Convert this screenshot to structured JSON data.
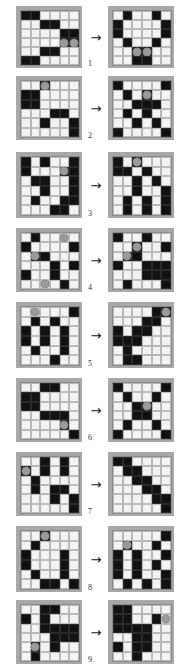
{
  "figure": {
    "type": "puzzle-sequence",
    "arrow_glyph": "→",
    "arrow_icon_name": "right-arrow-icon",
    "rows": 6,
    "cols": 6,
    "colors": {
      "page_background": "#ffffff",
      "frame": "#a8a8a8",
      "cell_white": "#f4f4f2",
      "cell_black": "#111111",
      "cell_border": "#b9b9b9",
      "dot": "#9a9a9a",
      "label_text": "#333333"
    }
  },
  "pairs": [
    {
      "number": "1",
      "left": {
        "cells": [
          [
            "b",
            "b",
            "w",
            "w",
            "w",
            "w"
          ],
          [
            "w",
            "w",
            "b",
            "b",
            "w",
            "w"
          ],
          [
            "w",
            "w",
            "w",
            "w",
            "b",
            "b"
          ],
          [
            "w",
            "w",
            "w",
            "w",
            "b",
            "b"
          ],
          [
            "w",
            "w",
            "b",
            "b",
            "w",
            "w"
          ],
          [
            "b",
            "b",
            "w",
            "w",
            "w",
            "w"
          ]
        ],
        "dots": [
          [
            3,
            4
          ],
          [
            3,
            5
          ]
        ]
      },
      "right": {
        "cells": [
          [
            "w",
            "b",
            "w",
            "w",
            "b",
            "w"
          ],
          [
            "b",
            "w",
            "w",
            "w",
            "w",
            "b"
          ],
          [
            "b",
            "w",
            "w",
            "w",
            "w",
            "b"
          ],
          [
            "w",
            "b",
            "w",
            "w",
            "b",
            "w"
          ],
          [
            "w",
            "w",
            "b",
            "b",
            "w",
            "w"
          ],
          [
            "w",
            "w",
            "b",
            "b",
            "w",
            "w"
          ]
        ],
        "dots": [
          [
            4,
            2
          ],
          [
            4,
            3
          ]
        ]
      }
    },
    {
      "number": "2",
      "left": {
        "cells": [
          [
            "w",
            "w",
            "b",
            "w",
            "w",
            "w"
          ],
          [
            "b",
            "b",
            "w",
            "w",
            "w",
            "w"
          ],
          [
            "b",
            "b",
            "w",
            "w",
            "w",
            "w"
          ],
          [
            "w",
            "w",
            "w",
            "b",
            "b",
            "w"
          ],
          [
            "w",
            "w",
            "b",
            "w",
            "w",
            "b"
          ],
          [
            "w",
            "w",
            "w",
            "w",
            "w",
            "b"
          ]
        ],
        "dots": [
          [
            0,
            2
          ]
        ]
      },
      "right": {
        "cells": [
          [
            "b",
            "w",
            "w",
            "w",
            "w",
            "b"
          ],
          [
            "w",
            "b",
            "w",
            "b",
            "w",
            "w"
          ],
          [
            "w",
            "w",
            "b",
            "b",
            "b",
            "w"
          ],
          [
            "w",
            "b",
            "w",
            "b",
            "w",
            "w"
          ],
          [
            "w",
            "w",
            "b",
            "w",
            "b",
            "w"
          ],
          [
            "b",
            "w",
            "w",
            "w",
            "w",
            "b"
          ]
        ],
        "dots": [
          [
            1,
            3
          ]
        ]
      }
    },
    {
      "number": "3",
      "left": {
        "cells": [
          [
            "b",
            "w",
            "b",
            "w",
            "w",
            "b"
          ],
          [
            "b",
            "w",
            "w",
            "w",
            "b",
            "b"
          ],
          [
            "w",
            "b",
            "b",
            "w",
            "w",
            "b"
          ],
          [
            "w",
            "w",
            "b",
            "w",
            "w",
            "b"
          ],
          [
            "w",
            "b",
            "w",
            "w",
            "b",
            "b"
          ],
          [
            "w",
            "w",
            "w",
            "b",
            "b",
            "w"
          ]
        ],
        "dots": [
          [
            1,
            4
          ]
        ]
      },
      "right": {
        "cells": [
          [
            "b",
            "w",
            "b",
            "w",
            "w",
            "w"
          ],
          [
            "b",
            "b",
            "w",
            "b",
            "w",
            "w"
          ],
          [
            "w",
            "w",
            "b",
            "w",
            "b",
            "w"
          ],
          [
            "w",
            "w",
            "b",
            "w",
            "w",
            "b"
          ],
          [
            "w",
            "b",
            "w",
            "b",
            "w",
            "b"
          ],
          [
            "w",
            "b",
            "w",
            "b",
            "w",
            "b"
          ]
        ],
        "dots": [
          [
            0,
            2
          ]
        ]
      }
    },
    {
      "number": "4",
      "left": {
        "cells": [
          [
            "w",
            "b",
            "w",
            "w",
            "w",
            "w"
          ],
          [
            "b",
            "w",
            "w",
            "w",
            "w",
            "b"
          ],
          [
            "w",
            "b",
            "b",
            "w",
            "w",
            "w"
          ],
          [
            "w",
            "w",
            "w",
            "b",
            "w",
            "b"
          ],
          [
            "b",
            "w",
            "w",
            "b",
            "w",
            "w"
          ],
          [
            "w",
            "w",
            "w",
            "w",
            "b",
            "w"
          ]
        ],
        "dots": [
          [
            0,
            4
          ],
          [
            2,
            1
          ],
          [
            5,
            2
          ]
        ]
      },
      "right": {
        "cells": [
          [
            "b",
            "w",
            "w",
            "b",
            "w",
            "w"
          ],
          [
            "w",
            "w",
            "b",
            "w",
            "w",
            "b"
          ],
          [
            "w",
            "b",
            "b",
            "w",
            "w",
            "w"
          ],
          [
            "b",
            "w",
            "w",
            "b",
            "b",
            "b"
          ],
          [
            "w",
            "w",
            "w",
            "b",
            "b",
            "b"
          ],
          [
            "w",
            "b",
            "w",
            "w",
            "w",
            "b"
          ]
        ],
        "dots": [
          [
            1,
            2
          ],
          [
            2,
            1
          ]
        ]
      }
    },
    {
      "number": "5",
      "left": {
        "cells": [
          [
            "w",
            "w",
            "w",
            "w",
            "w",
            "b"
          ],
          [
            "w",
            "b",
            "w",
            "b",
            "w",
            "w"
          ],
          [
            "b",
            "w",
            "b",
            "w",
            "b",
            "w"
          ],
          [
            "b",
            "w",
            "b",
            "w",
            "b",
            "w"
          ],
          [
            "w",
            "b",
            "w",
            "w",
            "b",
            "w"
          ],
          [
            "w",
            "w",
            "w",
            "b",
            "w",
            "w"
          ]
        ],
        "dots": [
          [
            0,
            1
          ]
        ]
      },
      "right": {
        "cells": [
          [
            "w",
            "w",
            "w",
            "w",
            "b",
            "b"
          ],
          [
            "w",
            "w",
            "w",
            "b",
            "b",
            "w"
          ],
          [
            "b",
            "w",
            "b",
            "b",
            "w",
            "w"
          ],
          [
            "b",
            "b",
            "b",
            "w",
            "w",
            "w"
          ],
          [
            "w",
            "b",
            "w",
            "w",
            "w",
            "w"
          ],
          [
            "w",
            "b",
            "b",
            "w",
            "w",
            "w"
          ]
        ],
        "dots": [
          [
            0,
            5
          ]
        ]
      }
    },
    {
      "number": "6",
      "left": {
        "cells": [
          [
            "w",
            "w",
            "b",
            "b",
            "w",
            "w"
          ],
          [
            "b",
            "b",
            "w",
            "w",
            "w",
            "w"
          ],
          [
            "b",
            "b",
            "w",
            "w",
            "w",
            "w"
          ],
          [
            "w",
            "w",
            "b",
            "b",
            "b",
            "w"
          ],
          [
            "w",
            "w",
            "w",
            "w",
            "b",
            "w"
          ],
          [
            "w",
            "w",
            "w",
            "w",
            "w",
            "b"
          ]
        ],
        "dots": [
          [
            4,
            4
          ]
        ]
      },
      "right": {
        "cells": [
          [
            "b",
            "w",
            "w",
            "w",
            "w",
            "b"
          ],
          [
            "w",
            "b",
            "w",
            "w",
            "b",
            "w"
          ],
          [
            "w",
            "w",
            "b",
            "b",
            "w",
            "w"
          ],
          [
            "w",
            "w",
            "b",
            "b",
            "w",
            "w"
          ],
          [
            "w",
            "b",
            "w",
            "w",
            "b",
            "w"
          ],
          [
            "b",
            "w",
            "w",
            "w",
            "w",
            "b"
          ]
        ],
        "dots": [
          [
            2,
            3
          ]
        ]
      }
    },
    {
      "number": "7",
      "left": {
        "cells": [
          [
            "w",
            "w",
            "b",
            "w",
            "b",
            "w"
          ],
          [
            "b",
            "w",
            "b",
            "w",
            "b",
            "w"
          ],
          [
            "w",
            "b",
            "w",
            "w",
            "w",
            "w"
          ],
          [
            "w",
            "b",
            "w",
            "b",
            "b",
            "w"
          ],
          [
            "w",
            "w",
            "w",
            "b",
            "w",
            "b"
          ],
          [
            "w",
            "w",
            "w",
            "w",
            "w",
            "b"
          ]
        ],
        "dots": [
          [
            1,
            0
          ]
        ]
      },
      "right": {
        "cells": [
          [
            "b",
            "b",
            "w",
            "w",
            "w",
            "w"
          ],
          [
            "w",
            "b",
            "b",
            "w",
            "w",
            "w"
          ],
          [
            "w",
            "w",
            "b",
            "b",
            "w",
            "w"
          ],
          [
            "w",
            "w",
            "w",
            "b",
            "b",
            "w"
          ],
          [
            "w",
            "w",
            "w",
            "w",
            "b",
            "b"
          ],
          [
            "w",
            "w",
            "w",
            "w",
            "w",
            "b"
          ]
        ],
        "dots": []
      }
    },
    {
      "number": "8",
      "left": {
        "cells": [
          [
            "w",
            "w",
            "b",
            "w",
            "w",
            "w"
          ],
          [
            "w",
            "b",
            "w",
            "w",
            "w",
            "w"
          ],
          [
            "b",
            "w",
            "w",
            "w",
            "b",
            "w"
          ],
          [
            "b",
            "w",
            "w",
            "w",
            "b",
            "w"
          ],
          [
            "w",
            "b",
            "w",
            "w",
            "b",
            "w"
          ],
          [
            "w",
            "w",
            "b",
            "b",
            "w",
            "b"
          ]
        ],
        "dots": [
          [
            0,
            2
          ]
        ]
      },
      "right": {
        "cells": [
          [
            "w",
            "w",
            "w",
            "w",
            "w",
            "b"
          ],
          [
            "w",
            "b",
            "w",
            "w",
            "b",
            "w"
          ],
          [
            "b",
            "w",
            "b",
            "w",
            "w",
            "b"
          ],
          [
            "b",
            "w",
            "b",
            "w",
            "b",
            "w"
          ],
          [
            "b",
            "w",
            "b",
            "w",
            "w",
            "b"
          ],
          [
            "w",
            "b",
            "w",
            "b",
            "w",
            "b"
          ]
        ],
        "dots": [
          [
            1,
            1
          ]
        ]
      }
    },
    {
      "number": "9",
      "left": {
        "cells": [
          [
            "w",
            "w",
            "b",
            "b",
            "w",
            "w"
          ],
          [
            "b",
            "w",
            "b",
            "w",
            "w",
            "w"
          ],
          [
            "w",
            "w",
            "b",
            "b",
            "b",
            "b"
          ],
          [
            "w",
            "w",
            "w",
            "b",
            "b",
            "b"
          ],
          [
            "w",
            "b",
            "w",
            "b",
            "w",
            "w"
          ],
          [
            "w",
            "b",
            "w",
            "w",
            "w",
            "w"
          ]
        ],
        "dots": [
          [
            4,
            1
          ]
        ]
      },
      "right": {
        "cells": [
          [
            "b",
            "b",
            "w",
            "w",
            "w",
            "w"
          ],
          [
            "b",
            "b",
            "w",
            "w",
            "b",
            "w"
          ],
          [
            "b",
            "b",
            "b",
            "b",
            "w",
            "w"
          ],
          [
            "w",
            "w",
            "b",
            "b",
            "w",
            "w"
          ],
          [
            "b",
            "w",
            "b",
            "b",
            "w",
            "w"
          ],
          [
            "w",
            "w",
            "b",
            "w",
            "w",
            "w"
          ]
        ],
        "dots": [
          [
            1,
            5
          ]
        ]
      }
    }
  ]
}
